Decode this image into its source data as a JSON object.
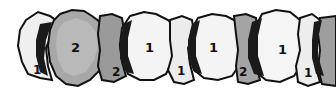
{
  "figure": {
    "colors": {
      "type1_fill": "#f2f2f2",
      "type2_fill": "#a9a9a9",
      "outline": "#111111",
      "shadow": "#1a1a1a",
      "background": "#ffffff"
    },
    "labels": [
      "1",
      "2",
      "2",
      "1",
      "1",
      "1",
      "2",
      "1",
      "1"
    ]
  }
}
